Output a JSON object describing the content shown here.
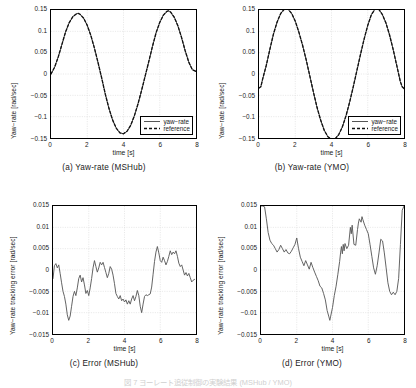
{
  "figure": {
    "caption_partial": "図 7 ヨーレート追従制御の実験結果 (MSHub / YMO)",
    "axis_color": "#000000",
    "grid_color": "#d9d9d9",
    "trace_color": "#595959",
    "reference_color": "#111111"
  },
  "panels": [
    {
      "id": "a",
      "subcaption": "(a) Yaw-rate (MSHub)",
      "ylabel": "Yaw−rate [rad/sec]",
      "xlabel": "time [s]",
      "yticks": [
        "0.15",
        "0.1",
        "0.05",
        "0",
        "−0.05",
        "−0.1",
        "−0.15"
      ],
      "xticks": [
        "0",
        "2",
        "4",
        "6",
        "8"
      ],
      "legend": [
        {
          "label": "yaw−rate",
          "style": "solid"
        },
        {
          "label": "reference",
          "style": "dashed"
        }
      ]
    },
    {
      "id": "b",
      "subcaption": "(b) Yaw-rate (YMO)",
      "ylabel": "Yaw−rate [rad/sec]",
      "xlabel": "time [s]",
      "yticks": [
        "0.15",
        "0.1",
        "0.05",
        "0",
        "−0.05",
        "−0.1",
        "−0.15"
      ],
      "xticks": [
        "0",
        "2",
        "4",
        "6",
        "8"
      ],
      "legend": [
        {
          "label": "yaw−rate",
          "style": "solid"
        },
        {
          "label": "reference",
          "style": "dashed"
        }
      ]
    },
    {
      "id": "c",
      "subcaption": "(c) Error (MSHub)",
      "ylabel": "Yaw−rate tracking error [rad/sec]",
      "xlabel": "time [s]",
      "yticks": [
        "0.015",
        "0.01",
        "0.005",
        "0",
        "−0.005",
        "−0.01",
        "−0.015"
      ],
      "xticks": [
        "0",
        "2",
        "4",
        "6",
        "8"
      ],
      "legend": []
    },
    {
      "id": "d",
      "subcaption": "(d) Error (YMO)",
      "ylabel": "Yaw−rate tracking error [rad/sec]",
      "xlabel": "time [s]",
      "yticks": [
        "0.015",
        "0.01",
        "0.005",
        "0",
        "−0.005",
        "−0.01",
        "−0.015"
      ],
      "xticks": [
        "0",
        "2",
        "4",
        "6",
        "8"
      ],
      "legend": []
    }
  ],
  "chart_data": [
    {
      "type": "line",
      "panel": "a",
      "title": "(a) Yaw-rate (MSHub)",
      "xlabel": "time [s]",
      "ylabel": "Yaw−rate [rad/sec]",
      "xlim": [
        0,
        8
      ],
      "ylim": [
        -0.15,
        0.15
      ],
      "xticks": [
        0,
        2,
        4,
        6,
        8
      ],
      "yticks": [
        -0.15,
        -0.1,
        -0.05,
        0,
        0.05,
        0.1,
        0.15
      ],
      "grid": true,
      "legend_position": "lower-right",
      "x": [
        0.0,
        0.2,
        0.4,
        0.6,
        0.8,
        1.0,
        1.2,
        1.4,
        1.5,
        1.6,
        1.8,
        2.0,
        2.2,
        2.4,
        2.6,
        2.8,
        3.0,
        3.2,
        3.4,
        3.6,
        3.8,
        4.0,
        4.2,
        4.4,
        4.6,
        4.8,
        5.0,
        5.2,
        5.4,
        5.6,
        5.8,
        6.0,
        6.2,
        6.4,
        6.5,
        6.6,
        6.8,
        7.0,
        7.2,
        7.4,
        7.6,
        7.8,
        8.0
      ],
      "series": [
        {
          "name": "yaw−rate",
          "style": "solid",
          "values": [
            0.0,
            0.016,
            0.04,
            0.069,
            0.098,
            0.12,
            0.134,
            0.141,
            0.142,
            0.14,
            0.131,
            0.114,
            0.09,
            0.06,
            0.026,
            -0.01,
            -0.048,
            -0.081,
            -0.108,
            -0.127,
            -0.138,
            -0.14,
            -0.134,
            -0.12,
            -0.098,
            -0.07,
            -0.038,
            -0.004,
            0.03,
            0.065,
            0.097,
            0.121,
            0.138,
            0.147,
            0.148,
            0.145,
            0.133,
            0.113,
            0.086,
            0.055,
            0.028,
            0.01,
            0.006
          ]
        },
        {
          "name": "reference",
          "style": "dashed",
          "values": [
            0.0,
            0.016,
            0.04,
            0.069,
            0.098,
            0.12,
            0.134,
            0.141,
            0.142,
            0.14,
            0.131,
            0.114,
            0.09,
            0.06,
            0.026,
            -0.01,
            -0.048,
            -0.081,
            -0.108,
            -0.127,
            -0.138,
            -0.14,
            -0.134,
            -0.12,
            -0.098,
            -0.07,
            -0.038,
            -0.004,
            0.03,
            0.065,
            0.097,
            0.121,
            0.138,
            0.147,
            0.148,
            0.145,
            0.133,
            0.113,
            0.086,
            0.055,
            0.028,
            0.01,
            0.006
          ]
        }
      ]
    },
    {
      "type": "line",
      "panel": "b",
      "title": "(b) Yaw-rate (YMO)",
      "xlabel": "time [s]",
      "ylabel": "Yaw−rate [rad/sec]",
      "xlim": [
        0,
        8
      ],
      "ylim": [
        -0.15,
        0.15
      ],
      "xticks": [
        0,
        2,
        4,
        6,
        8
      ],
      "yticks": [
        -0.15,
        -0.1,
        -0.05,
        0,
        0.05,
        0.1,
        0.15
      ],
      "grid": true,
      "legend_position": "lower-right",
      "x": [
        0.0,
        0.1,
        0.2,
        0.4,
        0.6,
        0.8,
        1.0,
        1.2,
        1.4,
        1.5,
        1.6,
        1.8,
        2.0,
        2.2,
        2.4,
        2.6,
        2.8,
        3.0,
        3.2,
        3.4,
        3.6,
        3.8,
        4.0,
        4.1,
        4.2,
        4.4,
        4.6,
        4.8,
        5.0,
        5.2,
        5.4,
        5.6,
        5.8,
        6.0,
        6.2,
        6.4,
        6.5,
        6.6,
        6.8,
        7.0,
        7.2,
        7.4,
        7.6,
        7.8,
        7.9,
        8.0
      ],
      "series": [
        {
          "name": "yaw−rate",
          "style": "solid",
          "values": [
            -0.033,
            -0.03,
            -0.012,
            0.02,
            0.058,
            0.094,
            0.122,
            0.142,
            0.152,
            0.154,
            0.152,
            0.142,
            0.124,
            0.098,
            0.068,
            0.034,
            -0.004,
            -0.042,
            -0.078,
            -0.108,
            -0.132,
            -0.147,
            -0.153,
            -0.154,
            -0.152,
            -0.142,
            -0.124,
            -0.098,
            -0.066,
            -0.03,
            0.008,
            0.046,
            0.082,
            0.114,
            0.139,
            0.152,
            0.154,
            0.152,
            0.14,
            0.12,
            0.092,
            0.058,
            0.02,
            -0.018,
            -0.03,
            -0.034
          ]
        },
        {
          "name": "reference",
          "style": "dashed",
          "values": [
            -0.033,
            -0.03,
            -0.012,
            0.02,
            0.058,
            0.094,
            0.122,
            0.142,
            0.152,
            0.154,
            0.152,
            0.142,
            0.124,
            0.098,
            0.068,
            0.034,
            -0.004,
            -0.042,
            -0.078,
            -0.108,
            -0.132,
            -0.147,
            -0.153,
            -0.154,
            -0.152,
            -0.142,
            -0.124,
            -0.098,
            -0.066,
            -0.03,
            0.008,
            0.046,
            0.082,
            0.114,
            0.139,
            0.152,
            0.154,
            0.152,
            0.14,
            0.12,
            0.092,
            0.058,
            0.02,
            -0.018,
            -0.03,
            -0.034
          ]
        }
      ]
    },
    {
      "type": "line",
      "panel": "c",
      "title": "(c) Error (MSHub)",
      "xlabel": "time [s]",
      "ylabel": "Yaw−rate tracking error [rad/sec]",
      "xlim": [
        0,
        8
      ],
      "ylim": [
        -0.015,
        0.015
      ],
      "xticks": [
        0,
        2,
        4,
        6,
        8
      ],
      "yticks": [
        -0.015,
        -0.01,
        -0.005,
        0,
        0.005,
        0.01,
        0.015
      ],
      "grid": true,
      "legend_position": "none",
      "x": [
        0.0,
        0.08,
        0.16,
        0.24,
        0.32,
        0.4,
        0.48,
        0.56,
        0.64,
        0.72,
        0.8,
        0.88,
        0.96,
        1.04,
        1.12,
        1.2,
        1.28,
        1.36,
        1.44,
        1.52,
        1.6,
        1.68,
        1.76,
        1.84,
        1.92,
        2.0,
        2.08,
        2.16,
        2.24,
        2.32,
        2.4,
        2.48,
        2.56,
        2.64,
        2.72,
        2.8,
        2.88,
        2.96,
        3.04,
        3.12,
        3.2,
        3.28,
        3.36,
        3.44,
        3.52,
        3.6,
        3.68,
        3.76,
        3.84,
        3.92,
        4.0,
        4.08,
        4.16,
        4.24,
        4.32,
        4.4,
        4.48,
        4.56,
        4.64,
        4.72,
        4.8,
        4.88,
        4.96,
        5.04,
        5.12,
        5.2,
        5.28,
        5.36,
        5.44,
        5.52,
        5.6,
        5.68,
        5.76,
        5.84,
        5.92,
        6.0,
        6.08,
        6.16,
        6.24,
        6.32,
        6.4,
        6.48,
        6.56,
        6.64,
        6.72,
        6.8,
        6.88,
        6.96,
        7.04,
        7.12,
        7.2,
        7.28,
        7.36,
        7.44,
        7.52,
        7.6,
        7.68,
        7.76,
        7.84,
        7.92,
        8.0
      ],
      "series": [
        {
          "name": "error",
          "style": "solid",
          "values": [
            -0.002,
            0.001,
            0.0015,
            0.0005,
            0.0012,
            -0.0008,
            -0.003,
            -0.005,
            -0.0062,
            -0.008,
            -0.0105,
            -0.0118,
            -0.0108,
            -0.0085,
            -0.0062,
            -0.005,
            -0.006,
            -0.0042,
            -0.002,
            -0.0012,
            -0.0028,
            -0.0018,
            -0.0035,
            -0.0055,
            -0.0048,
            -0.006,
            -0.0042,
            -0.002,
            0.0005,
            0.0022,
            0.0008,
            -0.0005,
            0.0005,
            0.0018,
            0.0012,
            0.0018,
            0.0006,
            -0.0006,
            -0.0018,
            -0.0008,
            0.0008,
            0.0002,
            -0.0012,
            -0.0032,
            -0.0055,
            -0.0062,
            -0.0068,
            -0.006,
            -0.0072,
            -0.0068,
            -0.0075,
            -0.007,
            -0.008,
            -0.0072,
            -0.008,
            -0.0068,
            -0.006,
            -0.0072,
            -0.0062,
            -0.0048,
            -0.006,
            -0.0085,
            -0.01,
            -0.008,
            -0.0062,
            -0.0058,
            -0.006,
            -0.0058,
            -0.0056,
            -0.004,
            -0.001,
            0.002,
            0.0042,
            0.0055,
            0.004,
            0.0022,
            0.0018,
            0.003,
            0.0022,
            0.0012,
            0.002,
            0.0032,
            0.0045,
            0.0036,
            0.0042,
            0.0038,
            0.0045,
            0.0032,
            0.0016,
            0.0008,
            0.0012,
            0.0,
            -0.0012,
            -0.0006,
            -0.0014,
            -0.0008,
            -0.0018,
            -0.0028,
            -0.0024,
            -0.0022
          ]
        }
      ]
    },
    {
      "type": "line",
      "panel": "d",
      "title": "(d) Error (YMO)",
      "xlabel": "time [s]",
      "ylabel": "Yaw−rate tracking error [rad/sec]",
      "xlim": [
        0,
        8
      ],
      "ylim": [
        -0.015,
        0.015
      ],
      "xticks": [
        0,
        2,
        4,
        6,
        8
      ],
      "yticks": [
        -0.015,
        -0.01,
        -0.005,
        0,
        0.005,
        0.01,
        0.015
      ],
      "grid": true,
      "legend_position": "none",
      "x": [
        0.0,
        0.1,
        0.2,
        0.3,
        0.4,
        0.5,
        0.6,
        0.7,
        0.8,
        0.9,
        1.0,
        1.1,
        1.2,
        1.3,
        1.4,
        1.5,
        1.6,
        1.7,
        1.8,
        1.9,
        2.0,
        2.1,
        2.2,
        2.3,
        2.4,
        2.5,
        2.6,
        2.7,
        2.8,
        2.9,
        3.0,
        3.1,
        3.2,
        3.3,
        3.4,
        3.5,
        3.6,
        3.7,
        3.8,
        3.85,
        3.9,
        4.0,
        4.1,
        4.2,
        4.3,
        4.4,
        4.45,
        4.5,
        4.55,
        4.6,
        4.65,
        4.7,
        4.8,
        4.9,
        5.0,
        5.05,
        5.1,
        5.2,
        5.3,
        5.4,
        5.45,
        5.5,
        5.6,
        5.65,
        5.7,
        5.8,
        5.9,
        6.0,
        6.1,
        6.2,
        6.3,
        6.4,
        6.5,
        6.6,
        6.7,
        6.8,
        6.9,
        7.0,
        7.1,
        7.2,
        7.3,
        7.4,
        7.5,
        7.6,
        7.7,
        7.8,
        7.9,
        8.0
      ],
      "series": [
        {
          "name": "error",
          "style": "solid",
          "values": [
            0.015,
            0.015,
            0.0148,
            0.012,
            0.0088,
            0.007,
            0.0062,
            0.0058,
            0.005,
            0.0042,
            0.0048,
            0.0058,
            0.005,
            0.0042,
            0.0048,
            0.004,
            0.0038,
            0.0044,
            0.0052,
            0.006,
            0.0075,
            0.005,
            0.003,
            0.002,
            0.001,
            0.0022,
            0.0012,
            0.0002,
            0.0018,
            0.0006,
            -0.0005,
            -0.0015,
            -0.0025,
            -0.0038,
            -0.0042,
            -0.0055,
            -0.007,
            -0.0095,
            -0.011,
            -0.0118,
            -0.0108,
            -0.0088,
            -0.006,
            -0.0038,
            -0.001,
            0.002,
            0.004,
            0.0055,
            0.0038,
            0.006,
            0.0045,
            0.0062,
            0.005,
            0.0058,
            0.01,
            0.0085,
            0.0105,
            0.006,
            0.0058,
            0.0095,
            0.011,
            0.012,
            0.0112,
            0.0125,
            0.0118,
            0.0105,
            0.0095,
            0.0085,
            0.006,
            0.0032,
            0.0005,
            -0.001,
            0.001,
            0.004,
            0.0072,
            0.0068,
            0.004,
            0.0005,
            -0.003,
            -0.005,
            -0.0058,
            -0.0052,
            -0.0058,
            -0.005,
            -0.002,
            0.006,
            0.014,
            0.015
          ]
        }
      ]
    }
  ]
}
